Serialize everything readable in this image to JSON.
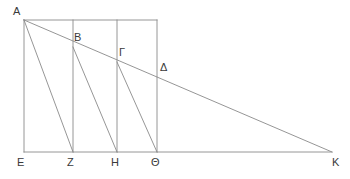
{
  "figure": {
    "stroke_color": "#8a8a8a",
    "label_color": "#3a3a3a",
    "background_color": "#ffffff",
    "stroke_width": 0.9,
    "canvas": {
      "width": 350,
      "height": 179
    }
  },
  "points": {
    "A": {
      "label": "A",
      "x": 24,
      "y": 20,
      "label_x": 13,
      "label_y": 6
    },
    "B": {
      "label": "B",
      "x": 73,
      "y": 47,
      "label_x": 74,
      "label_y": 32
    },
    "G": {
      "label": "Γ",
      "x": 117,
      "y": 62,
      "label_x": 119,
      "label_y": 47
    },
    "D": {
      "label": "Δ",
      "x": 157,
      "y": 77,
      "label_x": 160,
      "label_y": 62
    },
    "E": {
      "label": "E",
      "x": 24,
      "y": 152,
      "label_x": 17,
      "label_y": 157
    },
    "Z": {
      "label": "Z",
      "x": 73,
      "y": 152,
      "label_x": 67,
      "label_y": 157
    },
    "H": {
      "label": "H",
      "x": 117,
      "y": 152,
      "label_x": 111,
      "label_y": 157
    },
    "Th": {
      "label": "Θ",
      "x": 157,
      "y": 152,
      "label_x": 151,
      "label_y": 157
    },
    "K": {
      "label": "K",
      "x": 332,
      "y": 152,
      "label_x": 332,
      "label_y": 157
    }
  },
  "segments": [
    {
      "name": "top-edge-A-to-theta-top",
      "x1": 24,
      "y1": 20,
      "x2": 157,
      "y2": 20
    },
    {
      "name": "baseline-E-to-K",
      "x1": 24,
      "y1": 152,
      "x2": 332,
      "y2": 152
    },
    {
      "name": "vertical-A-E",
      "x1": 24,
      "y1": 20,
      "x2": 24,
      "y2": 152
    },
    {
      "name": "vertical-Z",
      "x1": 73,
      "y1": 20,
      "x2": 73,
      "y2": 152
    },
    {
      "name": "vertical-H",
      "x1": 117,
      "y1": 20,
      "x2": 117,
      "y2": 152
    },
    {
      "name": "vertical-theta",
      "x1": 157,
      "y1": 20,
      "x2": 157,
      "y2": 152
    },
    {
      "name": "ray-A-to-K",
      "x1": 24,
      "y1": 20,
      "x2": 332,
      "y2": 152
    },
    {
      "name": "diagonal-A-to-Z",
      "x1": 24,
      "y1": 20,
      "x2": 73,
      "y2": 152
    },
    {
      "name": "diagonal-B-to-H",
      "x1": 73,
      "y1": 47,
      "x2": 117,
      "y2": 152
    },
    {
      "name": "diagonal-gamma-to-theta",
      "x1": 117,
      "y1": 62,
      "x2": 157,
      "y2": 152
    }
  ]
}
